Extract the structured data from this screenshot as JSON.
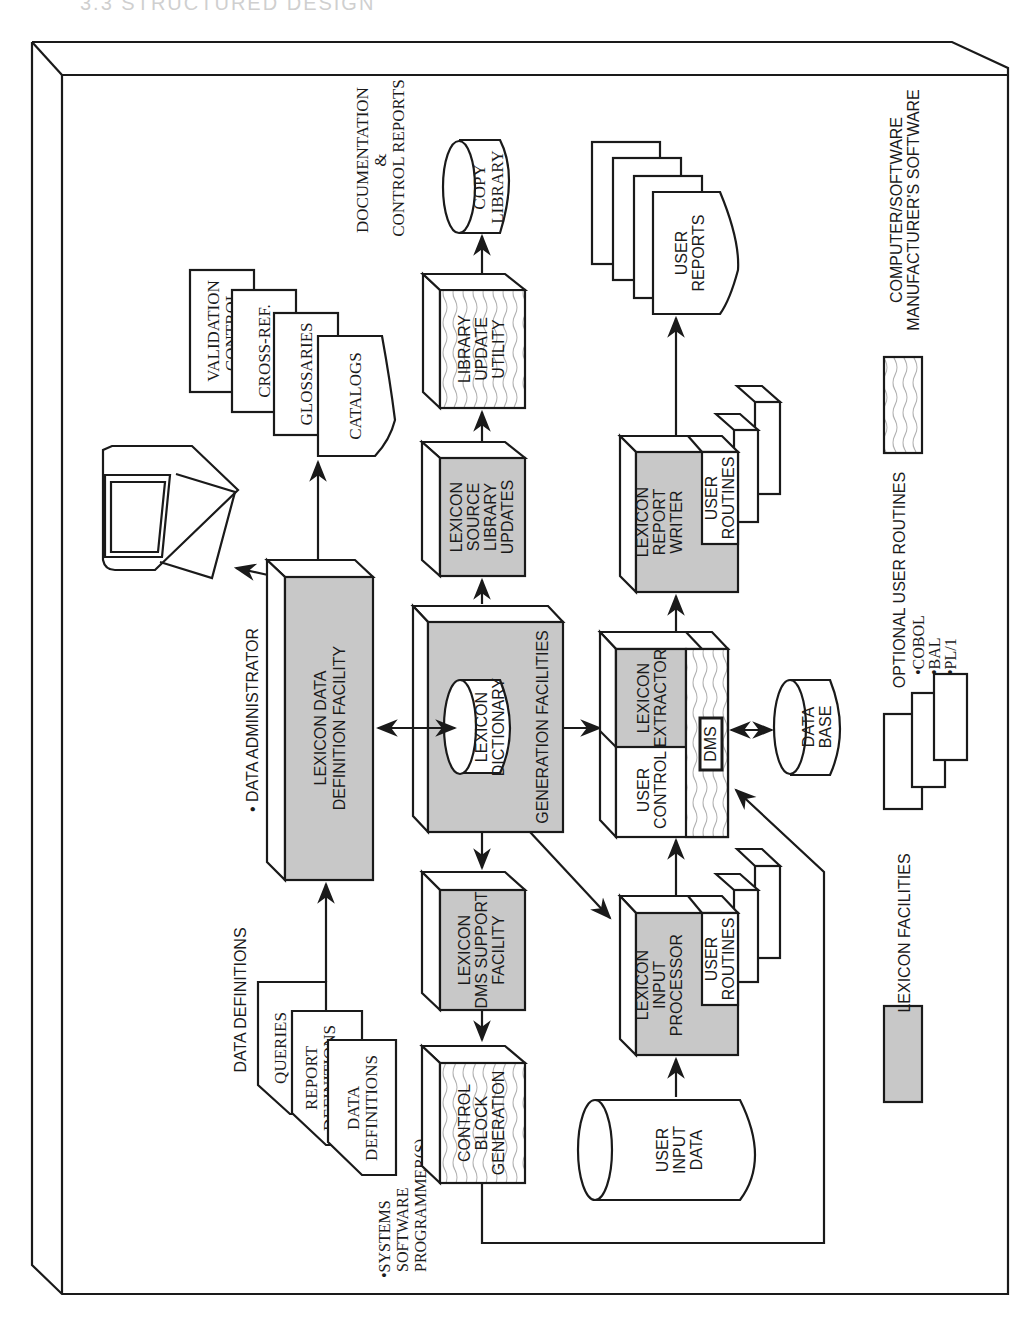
{
  "header": {
    "text": "3.3 STRUCTURED DESIGN"
  },
  "nodes": {
    "validation_control": "VALIDATION|CONTROL",
    "cross_ref": "CROSS-REF.",
    "glossaries": "GLOSSARIES",
    "catalogs": "CATALOGS",
    "documentation_label": "DOCUMENTATION|&|CONTROL REPORTS",
    "copy_library": "COPY|LIBRARY",
    "library_update_utility": "LIBRARY|UPDATE|UTILITY",
    "lexicon_source_library_updates": "LEXICON|SOURCE|LIBRARY|UPDATES",
    "user_reports": "USER|REPORTS",
    "lexicon_report_writer": "LEXICON|REPORT|WRITER",
    "user_routines_rw": "USER|ROUTINES",
    "data_administrator": "• DATA ADMINISTRATOR",
    "lexicon_data_definition_facility": "LEXICON DATA|DEFINITION FACILITY",
    "generation_facilities": "GENERATION  FACILITIES",
    "lexicon_dictionary": "LEXICON|DICTIONARY",
    "lexicon_extractor": "LEXICON|EXTRACTOR",
    "user_control": "USER|CONTROL",
    "dms": "DMS",
    "data_base": "DATA|BASE",
    "data_definitions_label": "DATA DEFINITIONS",
    "queries": "QUERIES",
    "report_definitions": "REPORT|DEFINITIONS",
    "data_definitions": "DATA|DEFINITIONS",
    "systems_programmer": "•SYSTEMS|SOFTWARE|PROGRAMMER(S)",
    "lexicon_dms_support_facility": "LEXICON|DMS SUPPORT|FACILITY",
    "control_block_generation": "CONTROL|BLOCK|GENERATION",
    "lexicon_input_processor": "LEXICON|INPUT|PROCESSOR",
    "user_routines_ip": "USER|ROUTINES",
    "user_input_data": "USER|INPUT|DATA"
  },
  "legend": {
    "lexicon_facilities": "LEXICON FACILITIES",
    "optional_user_routines": "OPTIONAL USER ROUTINES",
    "languages": [
      "•COBOL",
      "•BAL",
      "•PL/1"
    ],
    "computer_software": "COMPUTER/SOFTWARE|MANUFACTURER'S SOFTWARE"
  },
  "colors": {
    "lexicon_fill": "#c8c8c8",
    "line": "#1a1a1a",
    "wave": "#b0b0b0"
  }
}
